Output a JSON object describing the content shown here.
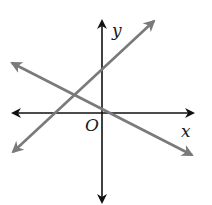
{
  "diagram": {
    "type": "coordinate-plane",
    "axes": {
      "x_label": "x",
      "y_label": "y",
      "origin_label": "O",
      "axis_color": "#111111"
    },
    "lines": [
      {
        "name": "line-positive-slope",
        "color": "#7a7a7a",
        "slope_sign": "positive",
        "y_intercept": "positive"
      },
      {
        "name": "line-negative-slope",
        "color": "#7a7a7a",
        "slope_sign": "negative",
        "y_intercept": "positive"
      }
    ]
  }
}
